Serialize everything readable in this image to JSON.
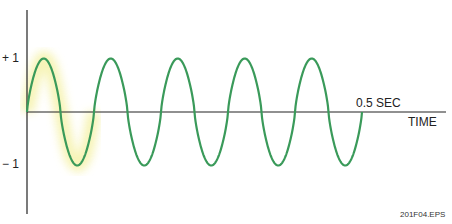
{
  "labels": {
    "plus_one": "+ 1",
    "minus_one": "− 1",
    "duration": "0.5 SEC",
    "x_axis": "TIME",
    "figure_id": "201F04.EPS"
  },
  "colors": {
    "wave": "#3a9a5a",
    "axis": "#222222",
    "highlight": "#f6f3b0"
  },
  "chart_data": {
    "type": "line",
    "title": "",
    "xlabel": "TIME",
    "ylabel": "",
    "amplitude": 1,
    "cycles": 5,
    "duration_sec": 0.5,
    "frequency_hz": 10,
    "ylim": [
      -1,
      1
    ],
    "yticks": [
      "+1",
      "-1"
    ],
    "annotations": [
      "0.5 SEC"
    ]
  }
}
